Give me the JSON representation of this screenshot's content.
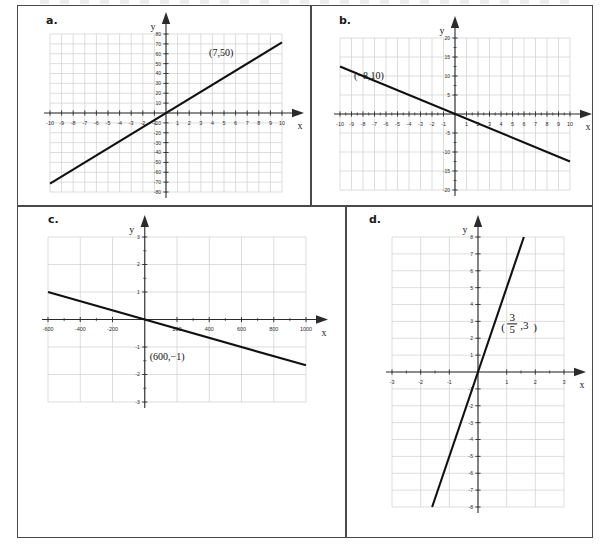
{
  "document": {
    "title": "Four coordinate-plane line graphs",
    "panel_count": 4
  },
  "style": {
    "grid_color": "#cfcfcf",
    "axis_color": "#2b2b2b",
    "line_color": "#111111",
    "border_color": "#4a4a4a",
    "background": "#ffffff"
  },
  "panels": [
    {
      "id": "a",
      "letter": "a."
    },
    {
      "id": "b",
      "letter": "b."
    },
    {
      "id": "c",
      "letter": "c."
    },
    {
      "id": "d",
      "letter": "d."
    }
  ],
  "chart_data": [
    {
      "id": "a",
      "type": "line",
      "title": "a.",
      "xlabel": "x",
      "ylabel": "y",
      "xlim": [
        -10,
        10
      ],
      "ylim": [
        -80,
        80
      ],
      "xticks": [
        -10,
        -9,
        -8,
        -7,
        -6,
        -5,
        -4,
        -3,
        -2,
        -1,
        1,
        2,
        3,
        4,
        5,
        6,
        7,
        8,
        9,
        10
      ],
      "xtick_labels": [
        "-10",
        "-9",
        "-8",
        "-7",
        "-6",
        "-5",
        "-4",
        "-3",
        "-2",
        "-1",
        "1",
        "2",
        "3",
        "4",
        "5",
        "6",
        "7",
        "8",
        "9",
        "10"
      ],
      "yticks": [
        -80,
        -70,
        -60,
        -50,
        -40,
        -30,
        -20,
        -10,
        10,
        20,
        30,
        40,
        50,
        60,
        70,
        80
      ],
      "ytick_labels": [
        "-80",
        "-70",
        "-60",
        "-50",
        "-40",
        "-30",
        "-20",
        "-10",
        "10",
        "20",
        "30",
        "40",
        "50",
        "60",
        "70",
        "80"
      ],
      "xgrid_step": 1,
      "ygrid_step": 10,
      "grid": true,
      "slope": 7.142857,
      "intercept": 0,
      "series": [
        {
          "name": "line",
          "x": [
            -10,
            10
          ],
          "y": [
            -71.43,
            71.43
          ]
        }
      ],
      "annotations": [
        {
          "text": "(7,50)",
          "x": 7,
          "y": 50,
          "dx": -26,
          "dy": -8
        }
      ]
    },
    {
      "id": "b",
      "type": "line",
      "title": "b.",
      "xlabel": "x",
      "ylabel": "y",
      "xlim": [
        -10,
        10
      ],
      "ylim": [
        -20,
        20
      ],
      "xticks": [
        -10,
        -9,
        -8,
        -7,
        -6,
        -5,
        -4,
        -3,
        -2,
        -1,
        1,
        2,
        3,
        4,
        5,
        6,
        7,
        8,
        9,
        10
      ],
      "xtick_labels": [
        "-10",
        "-9",
        "-8",
        "-7",
        "-6",
        "-5",
        "-4",
        "-3",
        "-2",
        "-1",
        "1",
        "2",
        "3",
        "4",
        "5",
        "6",
        "7",
        "8",
        "9",
        "10"
      ],
      "yticks": [
        -20,
        -15,
        -10,
        -5,
        5,
        10,
        15,
        20
      ],
      "ytick_labels": [
        "-20",
        "-15",
        "-10",
        "-5",
        "5",
        "10",
        "15",
        "20"
      ],
      "xgrid_step": 1,
      "ygrid_step": 5,
      "grid": true,
      "slope": -1.25,
      "intercept": 0,
      "series": [
        {
          "name": "line",
          "x": [
            -10,
            10
          ],
          "y": [
            12.5,
            -12.5
          ]
        }
      ],
      "annotations": [
        {
          "text": "(−8,10)",
          "x": -8,
          "y": 10,
          "dx": 6,
          "dy": 3
        }
      ]
    },
    {
      "id": "c",
      "type": "line",
      "title": "c.",
      "xlabel": "x",
      "ylabel": "y",
      "xlim": [
        -600,
        1000
      ],
      "ylim": [
        -3,
        3
      ],
      "xticks": [
        -600,
        -400,
        -200,
        200,
        400,
        600,
        800,
        1000
      ],
      "xtick_labels": [
        "-600",
        "-400",
        "-200",
        "200",
        "400",
        "600",
        "800",
        "1000"
      ],
      "yticks": [
        -3,
        -2,
        -1,
        1,
        2,
        3
      ],
      "ytick_labels": [
        "-3",
        "-2",
        "-1",
        "1",
        "2",
        "3"
      ],
      "xgrid_step": 200,
      "ygrid_step": 1,
      "grid": true,
      "slope": -0.0016667,
      "intercept": 0,
      "series": [
        {
          "name": "line",
          "x": [
            -600,
            1000
          ],
          "y": [
            1,
            -1.667
          ]
        }
      ],
      "annotations": [
        {
          "text": "(600,−1)",
          "x": 300,
          "y": -1.15,
          "dx": -26,
          "dy": 9
        }
      ]
    },
    {
      "id": "d",
      "type": "line",
      "title": "d.",
      "xlabel": "x",
      "ylabel": "y",
      "xlim": [
        -3,
        3
      ],
      "ylim": [
        -8,
        8
      ],
      "xticks": [
        -3,
        -2,
        -1,
        1,
        2,
        3
      ],
      "xtick_labels": [
        "-3",
        "-2",
        "-1",
        "1",
        "2",
        "3"
      ],
      "yticks": [
        -8,
        -7,
        -6,
        -5,
        -4,
        -3,
        -2,
        -1,
        1,
        2,
        3,
        4,
        5,
        6,
        7,
        8
      ],
      "ytick_labels": [
        "-8",
        "-7",
        "-6",
        "-5",
        "-4",
        "-3",
        "-2",
        "-1",
        "1",
        "2",
        "3",
        "4",
        "5",
        "6",
        "7",
        "8"
      ],
      "xgrid_step": 1,
      "ygrid_step": 1,
      "grid": true,
      "slope": 5,
      "intercept": 0,
      "series": [
        {
          "name": "line",
          "x": [
            -1.6,
            1.6
          ],
          "y": [
            -8,
            8
          ]
        }
      ],
      "annotations": [
        {
          "text": "fraction",
          "numerator": "3",
          "denominator": "5",
          "suffix": ",3",
          "x": 0.6,
          "y": 3,
          "dx": 8,
          "dy": 4
        }
      ]
    }
  ]
}
